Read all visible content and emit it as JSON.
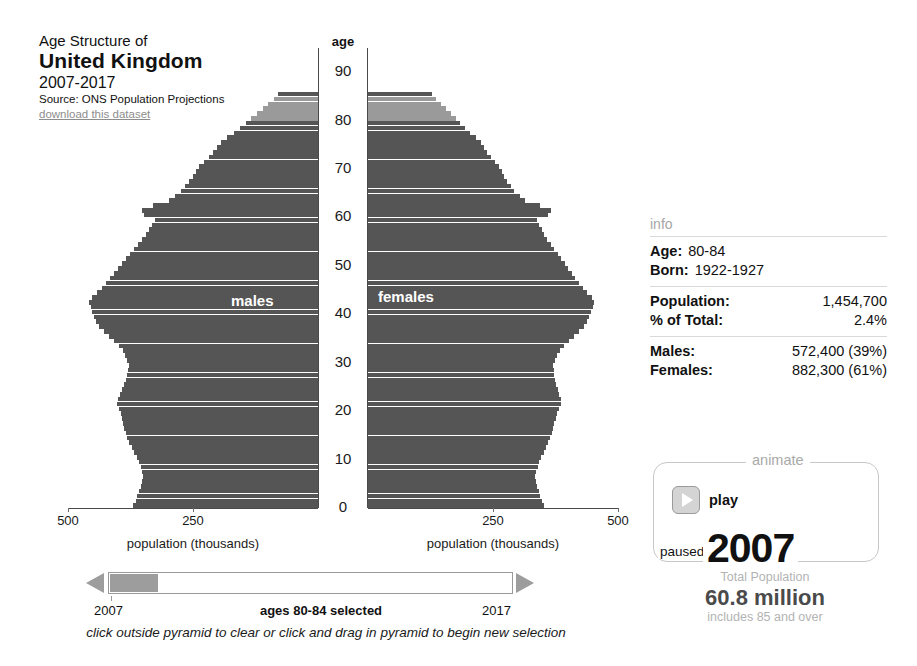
{
  "title": {
    "pre": "Age Structure of",
    "main": "United Kingdom",
    "years": "2007-2017",
    "source": "Source: ONS Population Projections",
    "download": "download this dataset"
  },
  "chart_labels": {
    "age_axis_title": "age",
    "x_axis_title": "population (thousands)",
    "males": "males",
    "females": "females"
  },
  "colors": {
    "bar_dark": "#555555",
    "bar_selected": "#9a9a9a",
    "axis": "#4a4a4a",
    "slider_handle": "#9d9d9d",
    "muted_text": "#a9a9a9"
  },
  "info": {
    "heading": "info",
    "age_key": "Age:",
    "age_value": "80-84",
    "born_key": "Born:",
    "born_value": "1922-1927",
    "population_key": "Population:",
    "population_value": "1,454,700",
    "pct_key": "% of Total:",
    "pct_value": "2.4%",
    "males_key": "Males:",
    "males_value": "572,400 (39%)",
    "females_key": "Females:",
    "females_value": "882,300 (61%)"
  },
  "animate": {
    "legend": "animate",
    "play_label": "play",
    "state_label": "paused",
    "year": "2007",
    "total_caption": "Total Population",
    "total_value": "60.8 million",
    "total_note": "includes 85 and over"
  },
  "timeline": {
    "start_year": "2007",
    "end_year": "2017",
    "selection_label": "ages 80-84 selected",
    "hint": "click outside pyramid to clear or click and drag in pyramid to begin new selection"
  },
  "chart_data": {
    "type": "bar",
    "orientation": "horizontal-pyramid",
    "title": "Age Structure of United Kingdom 2007-2017",
    "xlabel": "population (thousands)",
    "ylabel": "age",
    "xlim": [
      0,
      500
    ],
    "ylim": [
      0,
      95
    ],
    "x_ticks": [
      500,
      250,
      0
    ],
    "x_ticks_right": [
      0,
      250,
      500
    ],
    "y_ticks": [
      0,
      10,
      20,
      30,
      40,
      50,
      60,
      70,
      80,
      90
    ],
    "grid": false,
    "legend": [
      "males",
      "females"
    ],
    "selected_ages": [
      80,
      84
    ],
    "selected_label": "ages 80-84 selected",
    "year": 2007,
    "total_population_millions": 60.8,
    "ages": [
      0,
      1,
      2,
      3,
      4,
      5,
      6,
      7,
      8,
      9,
      10,
      11,
      12,
      13,
      14,
      15,
      16,
      17,
      18,
      19,
      20,
      21,
      22,
      23,
      24,
      25,
      26,
      27,
      28,
      29,
      30,
      31,
      32,
      33,
      34,
      35,
      36,
      37,
      38,
      39,
      40,
      41,
      42,
      43,
      44,
      45,
      46,
      47,
      48,
      49,
      50,
      51,
      52,
      53,
      54,
      55,
      56,
      57,
      58,
      59,
      60,
      61,
      62,
      63,
      64,
      65,
      66,
      67,
      68,
      69,
      70,
      71,
      72,
      73,
      74,
      75,
      76,
      77,
      78,
      79,
      80,
      81,
      82,
      83,
      84,
      85
    ],
    "series": [
      {
        "name": "males",
        "values": [
          370,
          365,
          362,
          358,
          355,
          352,
          350,
          352,
          355,
          358,
          362,
          368,
          372,
          378,
          382,
          385,
          388,
          390,
          392,
          395,
          398,
          402,
          400,
          396,
          392,
          388,
          385,
          382,
          380,
          378,
          382,
          386,
          390,
          398,
          408,
          418,
          428,
          438,
          444,
          448,
          452,
          455,
          458,
          452,
          442,
          432,
          424,
          416,
          408,
          400,
          392,
          384,
          376,
          368,
          360,
          352,
          344,
          338,
          332,
          326,
          348,
          352,
          330,
          298,
          286,
          274,
          266,
          258,
          250,
          244,
          238,
          228,
          218,
          210,
          202,
          194,
          182,
          168,
          156,
          144,
          134,
          122,
          110,
          100,
          88,
          80
        ]
      },
      {
        "name": "females",
        "values": [
          352,
          348,
          344,
          341,
          338,
          335,
          334,
          336,
          339,
          342,
          346,
          351,
          355,
          360,
          364,
          367,
          370,
          372,
          375,
          378,
          382,
          386,
          385,
          382,
          379,
          376,
          374,
          372,
          371,
          370,
          374,
          378,
          383,
          391,
          401,
          411,
          421,
          431,
          437,
          441,
          445,
          449,
          452,
          447,
          438,
          429,
          421,
          414,
          407,
          400,
          393,
          386,
          379,
          372,
          365,
          358,
          352,
          347,
          342,
          337,
          360,
          365,
          344,
          314,
          303,
          292,
          285,
          278,
          272,
          267,
          262,
          253,
          245,
          238,
          232,
          226,
          216,
          204,
          194,
          184,
          176,
          166,
          156,
          146,
          136,
          128
        ]
      }
    ]
  }
}
